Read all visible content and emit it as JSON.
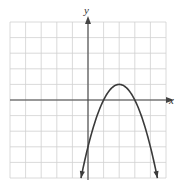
{
  "chart_data": {
    "type": "line",
    "title": "",
    "xlabel": "x",
    "ylabel": "y",
    "xlim": [
      -5,
      5
    ],
    "ylim": [
      -5,
      5
    ],
    "grid": true,
    "grid_step": 1,
    "tick_labels_shown": false,
    "series": [
      {
        "name": "parabola",
        "equation": "y = -(x - 2)^2 + 1",
        "vertex": [
          2,
          1
        ],
        "x_intercepts": [
          1,
          3
        ],
        "y_intercept": -3,
        "opens": "down",
        "x": [
          -0.45,
          0,
          0.5,
          1,
          1.5,
          2,
          2.5,
          3,
          3.5,
          4,
          4.45
        ],
        "y": [
          -5,
          -3,
          -1.25,
          0,
          0.75,
          1,
          0.75,
          0,
          -1.25,
          -3,
          -5
        ],
        "arrows_at_ends": true
      }
    ]
  },
  "colors": {
    "grid": "#d0d0d0",
    "axis": "#444444",
    "curve": "#3a3a3a",
    "background": "#ffffff"
  }
}
